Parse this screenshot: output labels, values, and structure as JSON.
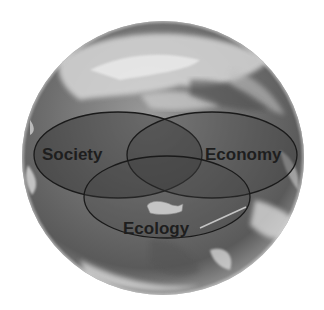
{
  "diagram": {
    "type": "venn",
    "background": "earth-globe",
    "sets": [
      {
        "id": "society",
        "label": "Society"
      },
      {
        "id": "economy",
        "label": "Economy"
      },
      {
        "id": "ecology",
        "label": "Ecology"
      }
    ],
    "colors": {
      "globe_dark": "#4a4a4a",
      "globe_mid": "#7a7a7a",
      "globe_light": "#d8d8d8",
      "ellipse_stroke": "#1a1a1a",
      "label": "#1e1e1e"
    }
  }
}
